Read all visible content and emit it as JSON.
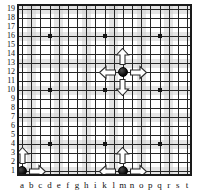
{
  "diagram": {
    "kind": "go-board-liberties-diagram",
    "board_size": 19,
    "title": "",
    "colors": {
      "board_background": "#ffffff",
      "grid_line": "#262626",
      "band_shade": "#cfcfcf",
      "border": "#1a1a1a",
      "stone_black": "#0d0d0d",
      "arrow_fill": "#ffffff",
      "arrow_outline": "#2a2a2a",
      "label_text": "#111111"
    }
  },
  "axes": {
    "column_labels": [
      "a",
      "b",
      "c",
      "d",
      "e",
      "f",
      "g",
      "h",
      "i",
      "k",
      "l",
      "m",
      "n",
      "o",
      "p",
      "q",
      "r",
      "s",
      "t"
    ],
    "row_labels": [
      "19",
      "18",
      "17",
      "16",
      "15",
      "14",
      "13",
      "12",
      "11",
      "10",
      "9",
      "8",
      "7",
      "6",
      "5",
      "4",
      "3",
      "2",
      "1"
    ]
  },
  "star_points": [
    {
      "col": "d",
      "row": 16
    },
    {
      "col": "k",
      "row": 16
    },
    {
      "col": "q",
      "row": 16
    },
    {
      "col": "d",
      "row": 10
    },
    {
      "col": "k",
      "row": 10
    },
    {
      "col": "q",
      "row": 10
    },
    {
      "col": "d",
      "row": 4
    },
    {
      "col": "k",
      "row": 4
    },
    {
      "col": "q",
      "row": 4
    }
  ],
  "stones": [
    {
      "id": "center-stone",
      "color": "black",
      "col": "m",
      "row": 12,
      "coordinate": "m12",
      "liberties": 4,
      "arrows": [
        "up",
        "down",
        "left",
        "right"
      ]
    },
    {
      "id": "edge-stone",
      "color": "black",
      "col": "m",
      "row": 1,
      "coordinate": "m1",
      "liberties": 3,
      "arrows": [
        "up",
        "left",
        "right"
      ]
    },
    {
      "id": "corner-stone",
      "color": "black",
      "col": "a",
      "row": 1,
      "coordinate": "a1",
      "liberties": 2,
      "arrows": [
        "up",
        "right"
      ]
    }
  ]
}
